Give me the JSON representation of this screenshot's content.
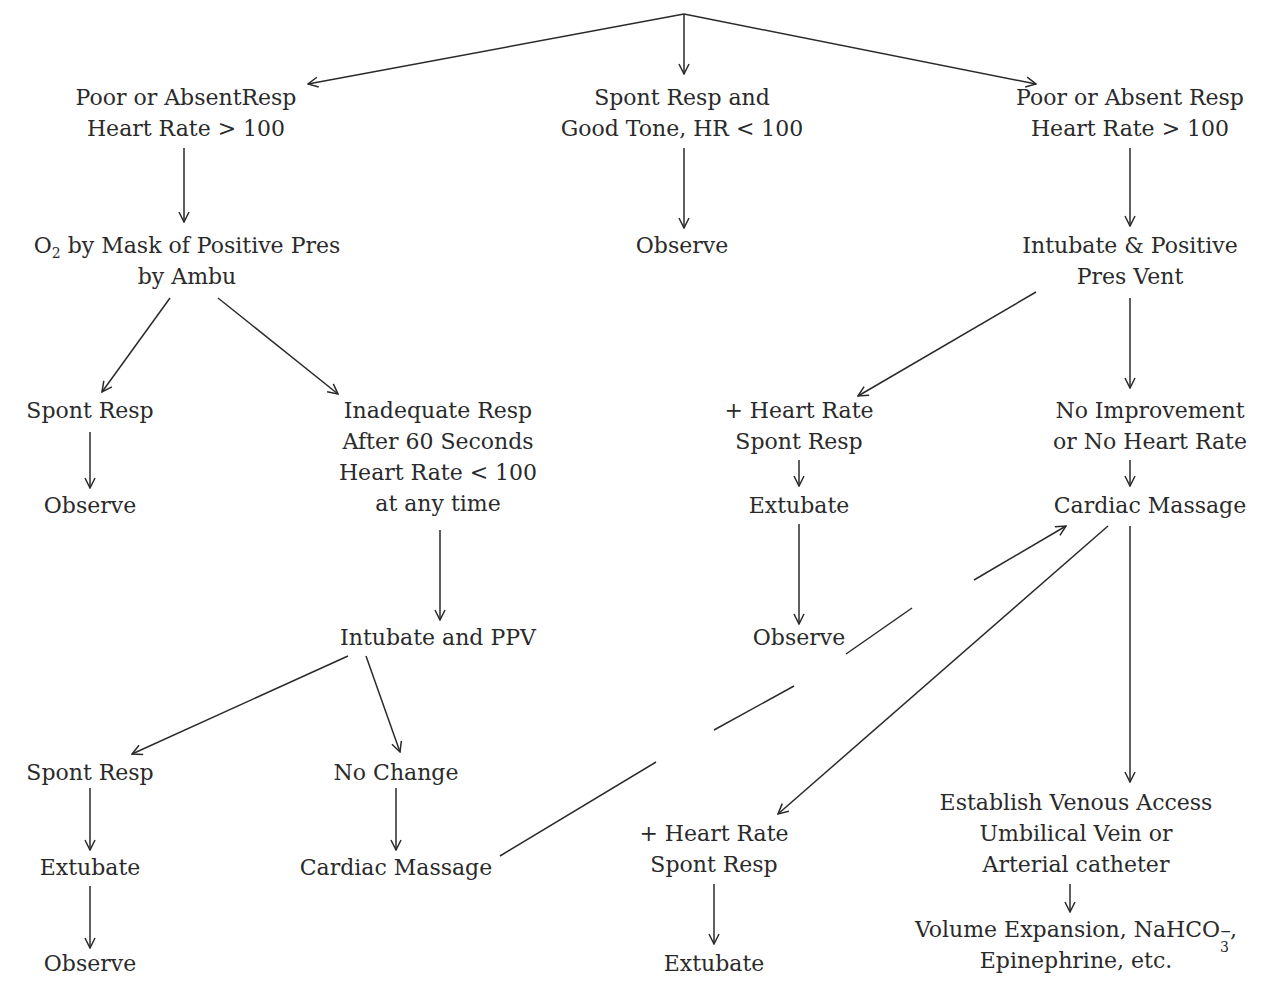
{
  "diagram": {
    "type": "flowchart",
    "nodes": {
      "poor_resp_left": {
        "lines": [
          "Poor or AbsentResp",
          "Heart Rate > 100"
        ]
      },
      "spont_good_tone": {
        "lines": [
          "Spont Resp and",
          "Good Tone, HR < 100"
        ]
      },
      "poor_resp_right": {
        "lines": [
          "Poor or Absent Resp",
          "Heart Rate > 100"
        ]
      },
      "o2_mask": {
        "line1_pre": "O",
        "line1_sub": "2",
        "line1_post": " by Mask of Positive Pres",
        "line2": "by Ambu"
      },
      "observe_top": {
        "lines": [
          "Observe"
        ]
      },
      "intubate_ppv_right": {
        "lines": [
          "Intubate & Positive",
          "Pres Vent"
        ]
      },
      "spont_resp_1": {
        "lines": [
          "Spont Resp"
        ]
      },
      "observe_1": {
        "lines": [
          "Observe"
        ]
      },
      "inadequate_resp": {
        "lines": [
          "Inadequate Resp",
          "After 60 Seconds",
          "Heart Rate < 100",
          "at any time"
        ]
      },
      "hr_spont_1": {
        "lines": [
          "+ Heart Rate",
          "Spont Resp"
        ]
      },
      "extubate_1": {
        "lines": [
          "Extubate"
        ]
      },
      "observe_2": {
        "lines": [
          "Observe"
        ]
      },
      "no_improvement": {
        "lines": [
          "No Improvement",
          "or No Heart Rate"
        ]
      },
      "cardiac_massage_right": {
        "lines": [
          "Cardiac Massage"
        ]
      },
      "intubate_ppv_left": {
        "lines": [
          "Intubate and PPV"
        ]
      },
      "spont_resp_2": {
        "lines": [
          "Spont Resp"
        ]
      },
      "extubate_2": {
        "lines": [
          "Extubate"
        ]
      },
      "observe_3": {
        "lines": [
          "Observe"
        ]
      },
      "no_change": {
        "lines": [
          "No Change"
        ]
      },
      "cardiac_massage_left": {
        "lines": [
          "Cardiac Massage"
        ]
      },
      "hr_spont_2": {
        "lines": [
          "+ Heart Rate",
          "Spont Resp"
        ]
      },
      "extubate_3": {
        "lines": [
          "Extubate"
        ]
      },
      "venous_access": {
        "lines": [
          "Establish Venous Access",
          "Umbilical Vein or",
          "Arterial catheter"
        ]
      },
      "volume_expansion": {
        "line1_pre": "Volume Expansion, NaHCO",
        "line1_sub": "3",
        "line1_sup": "−",
        "line1_post": ",",
        "line2": "Epinephrine, etc."
      }
    },
    "edges": [
      {
        "from": "root",
        "to": "poor_resp_left"
      },
      {
        "from": "root",
        "to": "spont_good_tone"
      },
      {
        "from": "root",
        "to": "poor_resp_right"
      },
      {
        "from": "poor_resp_left",
        "to": "o2_mask"
      },
      {
        "from": "spont_good_tone",
        "to": "observe_top"
      },
      {
        "from": "poor_resp_right",
        "to": "intubate_ppv_right"
      },
      {
        "from": "o2_mask",
        "to": "spont_resp_1"
      },
      {
        "from": "o2_mask",
        "to": "inadequate_resp"
      },
      {
        "from": "spont_resp_1",
        "to": "observe_1"
      },
      {
        "from": "inadequate_resp",
        "to": "intubate_ppv_left"
      },
      {
        "from": "intubate_ppv_right",
        "to": "hr_spont_1"
      },
      {
        "from": "intubate_ppv_right",
        "to": "no_improvement"
      },
      {
        "from": "hr_spont_1",
        "to": "extubate_1"
      },
      {
        "from": "extubate_1",
        "to": "observe_2"
      },
      {
        "from": "no_improvement",
        "to": "cardiac_massage_right"
      },
      {
        "from": "intubate_ppv_left",
        "to": "spont_resp_2"
      },
      {
        "from": "intubate_ppv_left",
        "to": "no_change"
      },
      {
        "from": "spont_resp_2",
        "to": "extubate_2"
      },
      {
        "from": "extubate_2",
        "to": "observe_3"
      },
      {
        "from": "no_change",
        "to": "cardiac_massage_left"
      },
      {
        "from": "cardiac_massage_left",
        "to": "cardiac_massage_right"
      },
      {
        "from": "cardiac_massage_right",
        "to": "hr_spont_2"
      },
      {
        "from": "cardiac_massage_right",
        "to": "venous_access"
      },
      {
        "from": "hr_spont_2",
        "to": "extubate_3"
      },
      {
        "from": "venous_access",
        "to": "volume_expansion"
      }
    ]
  }
}
